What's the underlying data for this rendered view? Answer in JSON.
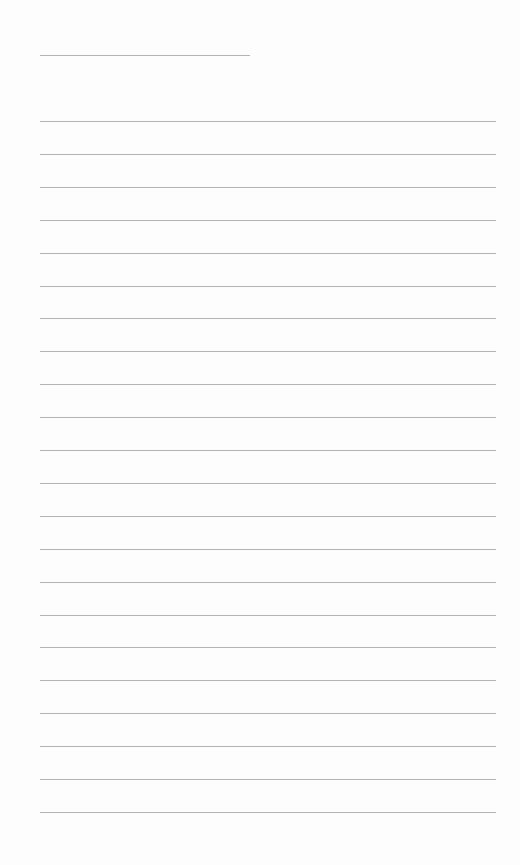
{
  "page": {
    "type": "lined-paper",
    "title_line": {
      "top": 55,
      "left": 40,
      "width": 210
    },
    "rules": {
      "first_top": 121,
      "spacing": 32.9,
      "count": 22,
      "left": 40,
      "width": 456
    },
    "line_color": "#9a9a9a",
    "background": "#fdfdfd"
  }
}
